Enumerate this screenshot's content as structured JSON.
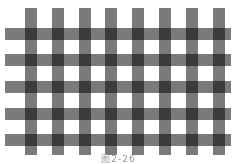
{
  "figure": {
    "caption": "图2-26",
    "bar_color": "#7a7a7a",
    "background": "#ffffff",
    "vertical_bars": [
      {
        "x": 25,
        "y": 8,
        "w": 12,
        "h": 147
      },
      {
        "x": 52,
        "y": 8,
        "w": 12,
        "h": 147
      },
      {
        "x": 79,
        "y": 8,
        "w": 12,
        "h": 147
      },
      {
        "x": 105,
        "y": 8,
        "w": 12,
        "h": 147
      },
      {
        "x": 132,
        "y": 8,
        "w": 12,
        "h": 147
      },
      {
        "x": 159,
        "y": 8,
        "w": 12,
        "h": 147
      },
      {
        "x": 186,
        "y": 8,
        "w": 12,
        "h": 147
      },
      {
        "x": 213,
        "y": 8,
        "w": 12,
        "h": 147
      }
    ],
    "horizontal_bars": [
      {
        "x": 5,
        "y": 28,
        "w": 226,
        "h": 12
      },
      {
        "x": 5,
        "y": 54,
        "w": 226,
        "h": 12
      },
      {
        "x": 5,
        "y": 81,
        "w": 226,
        "h": 12
      },
      {
        "x": 5,
        "y": 108,
        "w": 226,
        "h": 12
      },
      {
        "x": 5,
        "y": 134,
        "w": 226,
        "h": 12
      }
    ]
  }
}
